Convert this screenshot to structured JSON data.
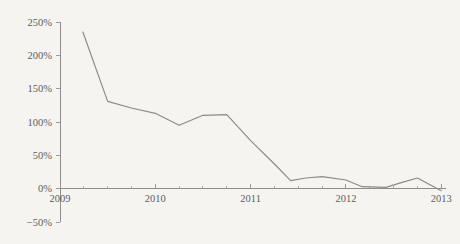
{
  "chart_data": {
    "type": "line",
    "title": "",
    "subtitle": "",
    "xlabel": "",
    "ylabel": "",
    "xlim": [
      2009.0,
      2013.05
    ],
    "ylim": [
      -50,
      250
    ],
    "grid": false,
    "legend": null,
    "y_ticks": [
      250,
      200,
      150,
      100,
      50,
      0,
      -50
    ],
    "y_tick_labels": [
      "250%",
      "200%",
      "150%",
      "100%",
      "50%",
      "0%",
      "−50%"
    ],
    "x_ticks": [
      2009,
      2010,
      2011,
      2012,
      2013
    ],
    "x_tick_labels": [
      "2009",
      "2010",
      "2011",
      "2012",
      "2013"
    ],
    "x_minor_ticks": [
      2009.25,
      2009.5,
      2009.75,
      2010.25,
      2010.5,
      2010.75,
      2011.25,
      2011.5,
      2011.75,
      2012.25,
      2012.5,
      2012.75
    ],
    "series": [
      {
        "name": "growth-rate",
        "color": "#8a8a8a",
        "x": [
          2009.24,
          2009.5,
          2009.75,
          2010.0,
          2010.25,
          2010.5,
          2010.75,
          2011.0,
          2011.25,
          2011.42,
          2011.58,
          2011.75,
          2012.0,
          2012.17,
          2012.42,
          2012.58,
          2012.75,
          2013.0
        ],
        "values": [
          235,
          131,
          121,
          113,
          95,
          110,
          111,
          72,
          37,
          12,
          16,
          18,
          13,
          3,
          2,
          9,
          16,
          -3
        ]
      }
    ],
    "axis_color": "#8d8d8d",
    "background_color": "#f6f4f0",
    "tick_label_color": "#5c5c5c"
  },
  "geometry": {
    "plot_left": 60,
    "plot_right": 446,
    "plot_top": 22,
    "plot_bottom": 222,
    "zero_y": 188
  }
}
